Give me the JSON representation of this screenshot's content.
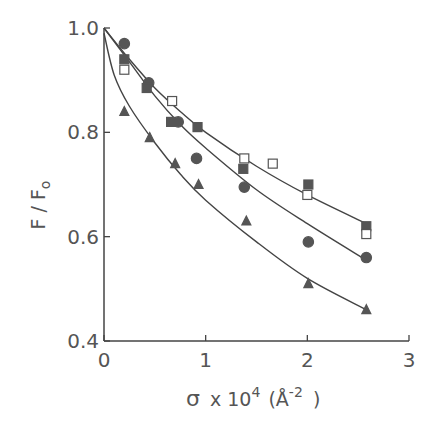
{
  "chart_data": {
    "type": "scatter",
    "title": "",
    "xlabel": "σ x 10⁴ (Å⁻²)",
    "ylabel": "F / F₀",
    "xlim": [
      0,
      3
    ],
    "ylim": [
      0.4,
      1.0
    ],
    "xticks": [
      0,
      1,
      2,
      3
    ],
    "yticks": [
      0.4,
      0.6,
      0.8,
      1.0
    ],
    "xtick_labels": [
      "0",
      "1",
      "2",
      "3"
    ],
    "ytick_labels": [
      "0.4",
      "0.6",
      "0.8",
      "1.0"
    ],
    "grid": false,
    "legend": null,
    "series": [
      {
        "name": "filled-circle",
        "marker": "circle",
        "filled": true,
        "x": [
          0.2,
          0.44,
          0.73,
          0.91,
          1.38,
          2.01,
          2.58
        ],
        "y": [
          0.97,
          0.895,
          0.82,
          0.75,
          0.695,
          0.59,
          0.56
        ]
      },
      {
        "name": "filled-square",
        "marker": "square",
        "filled": true,
        "x": [
          0.2,
          0.42,
          0.66,
          0.92,
          1.37,
          2.01,
          2.58
        ],
        "y": [
          0.94,
          0.885,
          0.82,
          0.81,
          0.73,
          0.7,
          0.62
        ]
      },
      {
        "name": "open-square",
        "marker": "square",
        "filled": false,
        "x": [
          0.2,
          0.67,
          1.38,
          1.66,
          2.0,
          2.58
        ],
        "y": [
          0.92,
          0.86,
          0.75,
          0.74,
          0.68,
          0.605
        ]
      },
      {
        "name": "filled-triangle",
        "marker": "triangle",
        "filled": true,
        "x": [
          0.2,
          0.45,
          0.7,
          0.93,
          1.4,
          2.01,
          2.58
        ],
        "y": [
          0.84,
          0.79,
          0.74,
          0.7,
          0.63,
          0.51,
          0.46
        ]
      }
    ],
    "fit_curves": [
      {
        "name": "upper-fit",
        "x": [
          0,
          0.25,
          0.5,
          0.75,
          1.0,
          1.5,
          2.0,
          2.58
        ],
        "y": [
          1.0,
          0.94,
          0.885,
          0.84,
          0.8,
          0.735,
          0.68,
          0.625
        ]
      },
      {
        "name": "middle-fit",
        "x": [
          0,
          0.25,
          0.5,
          0.75,
          1.0,
          1.5,
          2.0,
          2.58
        ],
        "y": [
          1.0,
          0.935,
          0.87,
          0.815,
          0.77,
          0.69,
          0.625,
          0.555
        ]
      },
      {
        "name": "lower-fit",
        "x": [
          0,
          0.1,
          0.25,
          0.5,
          0.75,
          1.0,
          1.5,
          2.0,
          2.58
        ],
        "y": [
          0.99,
          0.91,
          0.85,
          0.78,
          0.72,
          0.67,
          0.59,
          0.52,
          0.46
        ]
      }
    ]
  },
  "axes": {
    "ylabel_main": "F / F",
    "ylabel_sub": "o",
    "xlabel_sigma": "σ",
    "xlabel_times": "x 10",
    "xlabel_exp": "4",
    "xlabel_open": "(",
    "xlabel_unit": "Å",
    "xlabel_unit_exp": "-2",
    "xlabel_close": ")"
  },
  "colors": {
    "ink": "#444444",
    "marker": "#555555",
    "text": "#555555",
    "background": "#ffffff"
  }
}
